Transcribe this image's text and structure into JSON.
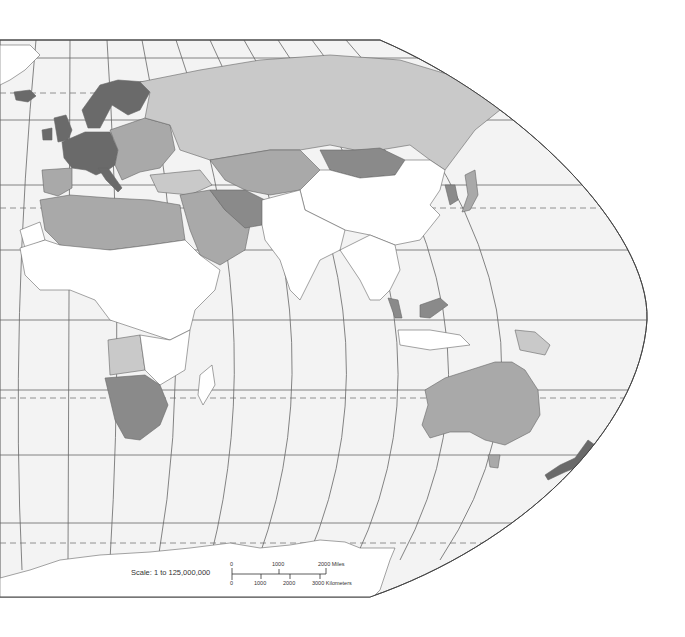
{
  "map": {
    "type": "thematic-choropleth-world-map",
    "projection": "eastern-hemisphere-pseudocylindrical",
    "palette": {
      "background": "#ffffff",
      "ocean": "#f3f3f3",
      "graticule": "#555555",
      "tropic_dashed": "#777777",
      "border": "#666666",
      "class_none": "#ffffff",
      "class_1": "#e8e8e8",
      "class_2": "#c9c9c9",
      "class_3": "#a9a9a9",
      "class_4": "#8a8a8a",
      "class_5": "#6a6a6a"
    },
    "regions": [
      {
        "name": "Greenland (partial)",
        "class": "class_none"
      },
      {
        "name": "Iceland",
        "class": "class_5"
      },
      {
        "name": "Scandinavia",
        "class": "class_5"
      },
      {
        "name": "Western Europe",
        "class": "class_5"
      },
      {
        "name": "Eastern Europe",
        "class": "class_3"
      },
      {
        "name": "Russia",
        "class": "class_2"
      },
      {
        "name": "Central Asia",
        "class": "class_3"
      },
      {
        "name": "Mongolia",
        "class": "class_4"
      },
      {
        "name": "China",
        "class": "class_none"
      },
      {
        "name": "Korea",
        "class": "class_4"
      },
      {
        "name": "Japan",
        "class": "class_3"
      },
      {
        "name": "Middle East",
        "class": "class_3"
      },
      {
        "name": "Iran",
        "class": "class_4"
      },
      {
        "name": "North Africa",
        "class": "class_3"
      },
      {
        "name": "Sub-Saharan Africa",
        "class": "class_none"
      },
      {
        "name": "Southern Africa",
        "class": "class_4"
      },
      {
        "name": "Angola",
        "class": "class_2"
      },
      {
        "name": "Southeast Asia",
        "class": "class_none"
      },
      {
        "name": "Malaysia",
        "class": "class_4"
      },
      {
        "name": "Papua New Guinea",
        "class": "class_2"
      },
      {
        "name": "Australia",
        "class": "class_3"
      },
      {
        "name": "New Zealand",
        "class": "class_5"
      },
      {
        "name": "Antarctica",
        "class": "class_none"
      }
    ]
  },
  "scale": {
    "label": "Scale:  1 to 125,000,000",
    "miles": {
      "ticks": [
        "0",
        "1000",
        "2000 Miles"
      ]
    },
    "kilometers": {
      "ticks": [
        "0",
        "1000",
        "2000",
        "3000 Kilometers"
      ]
    }
  }
}
